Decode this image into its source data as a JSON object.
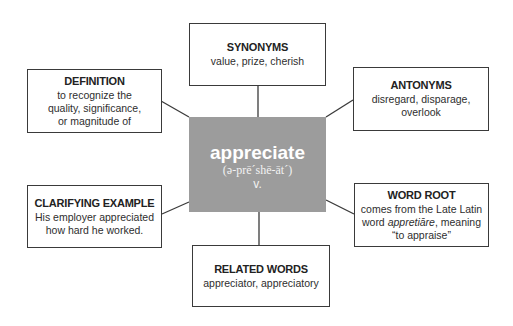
{
  "diagram": {
    "type": "word-map",
    "central": {
      "word": "appreciate",
      "pronunciation": "(ə-prē´shē-āt´)",
      "part_of_speech": "v.",
      "color": "#9c9c9c"
    },
    "nodes": {
      "synonyms": {
        "title": "SYNONYMS",
        "body": "value, prize, cherish"
      },
      "definition": {
        "title": "DEFINITION",
        "body_lines": [
          "to recognize the",
          "quality, significance,",
          "or magnitude of"
        ]
      },
      "antonyms": {
        "title": "ANTONYMS",
        "body_lines": [
          "disregard, disparage,",
          "overlook"
        ]
      },
      "clarifying_example": {
        "title": "CLARIFYING EXAMPLE",
        "body_lines": [
          "His employer appreciated",
          "how hard he worked."
        ]
      },
      "word_root": {
        "title": "WORD ROOT",
        "line1": "comes from the Late Latin",
        "line2_pre": "word ",
        "line2_italic": "appretiāre",
        "line2_post": ", meaning",
        "line3": "“to appraise”"
      },
      "related_words": {
        "title": "RELATED WORDS",
        "body": "appreciator, appreciatory"
      }
    },
    "edges": [
      [
        "central",
        "synonyms"
      ],
      [
        "central",
        "definition"
      ],
      [
        "central",
        "antonyms"
      ],
      [
        "central",
        "clarifying_example"
      ],
      [
        "central",
        "word_root"
      ],
      [
        "central",
        "related_words"
      ]
    ],
    "line_color": "#3a3a3a"
  }
}
